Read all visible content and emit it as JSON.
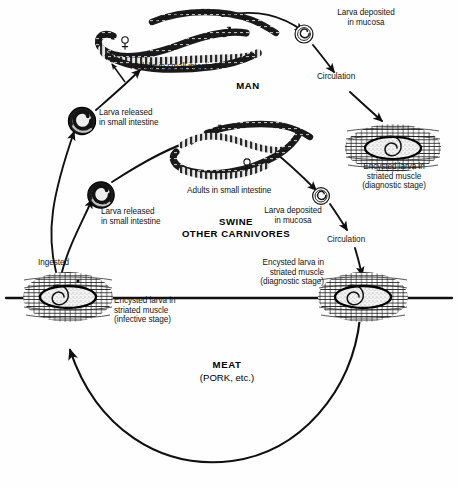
{
  "diagram": {
    "background_color": "#fefefe",
    "ink_color": "#101010"
  },
  "hosts": {
    "man": "MAN",
    "swine": "SWINE\nOTHER CARNIVORES",
    "meat_bold": "MEAT",
    "meat_sub": "(PORK, etc.)"
  },
  "labels": {
    "man_adults": "Adults in small intestine",
    "man_larva_deposited": "Larva deposited\nin mucosa",
    "man_circulation": "Circulation",
    "man_encysted": "Encysted larva in\nstriated muscle\n(diagnostic stage)",
    "larva_released_upper": "Larva released\nin small intestine",
    "larva_released_lower": "Larva released\nin small intestine",
    "swine_adults": "Adults in small intestine",
    "swine_larva_deposited": "Larva deposited\nin mucosa",
    "swine_circulation": "Circulation",
    "swine_encysted": "Encysted larva in\nstriated muscle\n(diagnostic stage)",
    "ingested": "Ingested",
    "infective_encysted": "Encysted larva in\nstriated muscle\n(infective stage)"
  },
  "sex_symbols": {
    "male": "♂",
    "female": "♀"
  },
  "stages": [
    {
      "id": "adults-man",
      "name": "Adults in small intestine (man)"
    },
    {
      "id": "larva-mucosa-man",
      "name": "Larva deposited in mucosa (man)"
    },
    {
      "id": "encysted-man",
      "name": "Encysted larva in striated muscle, diagnostic stage (man)"
    },
    {
      "id": "adults-swine",
      "name": "Adults in small intestine (swine)"
    },
    {
      "id": "larva-mucosa-swine",
      "name": "Larva deposited in mucosa (swine)"
    },
    {
      "id": "encysted-swine",
      "name": "Encysted larva in striated muscle, diagnostic stage (swine)"
    },
    {
      "id": "encysted-meat",
      "name": "Encysted larva in striated muscle, infective stage (meat)"
    },
    {
      "id": "larva-released-1",
      "name": "Larva released in small intestine (upper)"
    },
    {
      "id": "larva-released-2",
      "name": "Larva released in small intestine (lower)"
    }
  ]
}
